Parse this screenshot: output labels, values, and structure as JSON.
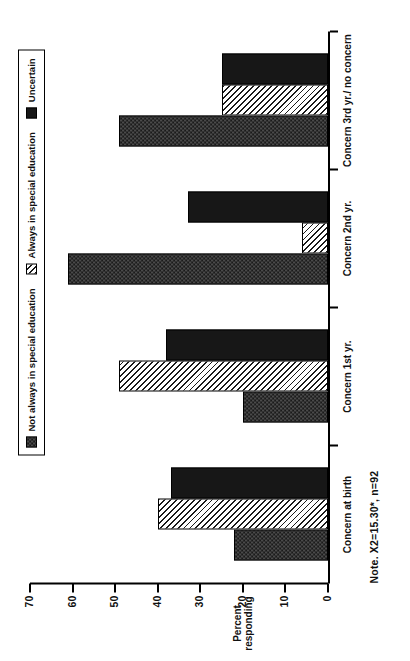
{
  "figure": {
    "note": "Note.  X2=15.30*,  n=92",
    "y_axis_title_line1": "Percent",
    "y_axis_title_line2": "responding"
  },
  "legend": {
    "items": [
      {
        "label": "Not always in special education",
        "swatch": "checker-dot-swatch",
        "color": "#3c3c3c"
      },
      {
        "label": "Always in special education",
        "swatch": "diagonal-hatch-swatch",
        "color": "#ffffff"
      },
      {
        "label": "Uncertain",
        "swatch": "solid-black-swatch",
        "color": "#171717"
      }
    ]
  },
  "chart_data": {
    "type": "bar",
    "title": "",
    "xlabel": "",
    "ylabel": "Percent responding",
    "ylim": [
      0,
      70
    ],
    "yticks": [
      0,
      10,
      20,
      30,
      40,
      50,
      60,
      70
    ],
    "grid": false,
    "legend_position": "top",
    "orientation": "vertical-rotated-90",
    "categories": [
      "Concern at birth",
      "Concern 1st yr.",
      "Concern 2nd yr.",
      "Concern 3rd yr./ no concern"
    ],
    "series": [
      {
        "name": "Not always in special education",
        "values": [
          22,
          20,
          61,
          49
        ]
      },
      {
        "name": "Always in special education",
        "values": [
          40,
          49,
          6,
          25
        ]
      },
      {
        "name": "Uncertain",
        "values": [
          37,
          38,
          33,
          25
        ]
      }
    ],
    "annotations": [
      "Note.  X2=15.30*,  n=92"
    ]
  }
}
